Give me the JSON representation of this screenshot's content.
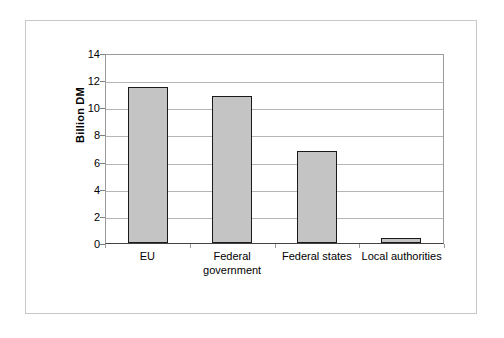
{
  "figure": {
    "background_color": "#ffffff",
    "frame_color": "#c8c8c8"
  },
  "chart_data": {
    "type": "bar",
    "title": "",
    "xlabel": "",
    "ylabel": "Billion DM",
    "categories": [
      "EU",
      "Federal\ngovernment",
      "Federal states",
      "Local authorities"
    ],
    "values": [
      11.5,
      10.8,
      6.8,
      0.2
    ],
    "ylim": [
      0,
      14
    ],
    "yticks": [
      0,
      2,
      4,
      6,
      8,
      10,
      12,
      14
    ],
    "ytick_labels": [
      "0",
      "2",
      "4",
      "6",
      "8",
      "10",
      "12",
      "14"
    ],
    "grid": true,
    "grid_axis": "y",
    "legend": false,
    "legend_position": "none",
    "bar_fill_color": "#c4c4c4",
    "bar_edge_color": "#1a1a1a",
    "gridline_color": "#b5b5b5",
    "axis_color": "#444444"
  }
}
